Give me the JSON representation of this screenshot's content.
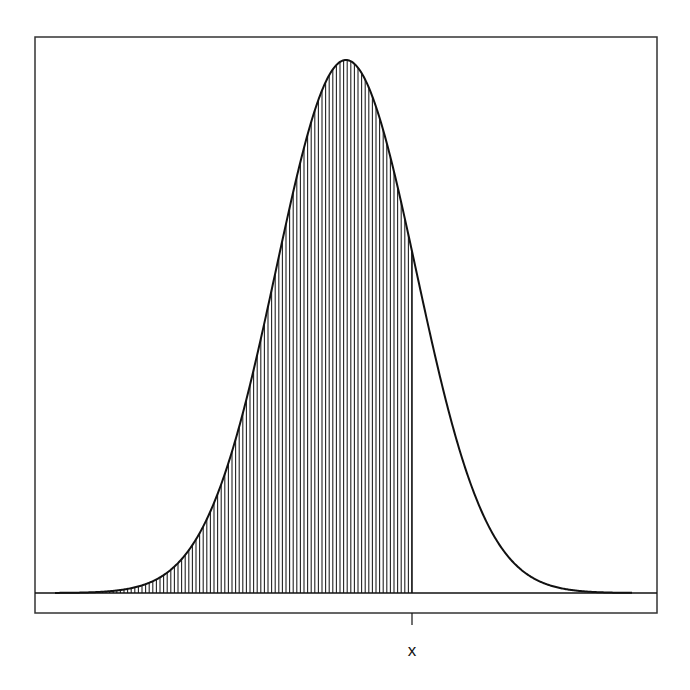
{
  "chart_data": {
    "type": "area",
    "title": "",
    "xlabel": "",
    "ylabel": "",
    "distribution": "normal",
    "mean": 0,
    "sd": 1,
    "x_range_sd": [
      -4.2,
      4.1
    ],
    "shaded_region": {
      "from": "-inf",
      "to": "x",
      "x_in_sd": 0.94
    },
    "tick_labels": [
      "x"
    ],
    "grid": false,
    "legend": null,
    "axes_visible": false,
    "box_frame": true,
    "baseline": true
  },
  "layout": {
    "frame": {
      "left": 35,
      "top": 37,
      "right": 657,
      "bottom": 613
    },
    "baseline_y": 593,
    "peak_y": 60,
    "mean_px": 346,
    "sd_px": 70,
    "curve_x_start": 55,
    "curve_x_end": 632,
    "cutoff_px": 412,
    "hatch_spacing": 3.6,
    "tick": {
      "x": 412,
      "y1": 613,
      "y2": 625
    },
    "label_y": 641
  },
  "colors": {
    "background": "#ffffff",
    "line": "#111111",
    "frame": "#333333",
    "hatch": "#222222"
  }
}
